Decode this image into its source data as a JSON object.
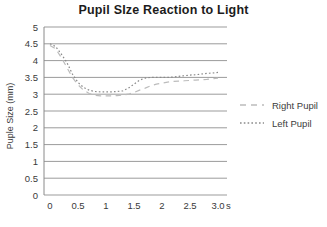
{
  "colors": {
    "background": "#ffffff",
    "grid": "#9b9b9b",
    "axis": "#8a8a8a",
    "tick_text": "#3a3a3a",
    "title_text": "#1c1c1c",
    "right_pupil_line": "#bcbcbc",
    "left_pupil_line": "#8a8a8a"
  },
  "chart_data": {
    "type": "line",
    "title": "Pupil SIze Reaction to Light",
    "ylabel": "Puple Size (mm)",
    "xlabel": "",
    "x_unit": "s",
    "xlim": [
      0,
      3
    ],
    "ylim": [
      0,
      5
    ],
    "grid": "horizontal",
    "legend_position": "right",
    "y_ticks": [
      "0",
      "0.5",
      "1",
      "1.5",
      "2",
      "2.5",
      "3",
      "3.5",
      "4",
      "4.5",
      "5"
    ],
    "x_ticks": [
      "0",
      "0.5",
      "1",
      "1.5",
      "2",
      "2.5",
      "3.0"
    ],
    "x": [
      0,
      0.1,
      0.2,
      0.3,
      0.4,
      0.5,
      0.6,
      0.7,
      0.8,
      0.9,
      1.0,
      1.1,
      1.2,
      1.3,
      1.4,
      1.5,
      1.6,
      1.7,
      1.8,
      1.9,
      2.0,
      2.1,
      2.2,
      2.3,
      2.4,
      2.5,
      2.6,
      2.7,
      2.8,
      2.9,
      3.0
    ],
    "series": [
      {
        "name": "Right Pupil",
        "style": "dashed",
        "color": "#bcbcbc",
        "values": [
          4.45,
          4.35,
          4.1,
          3.8,
          3.5,
          3.28,
          3.12,
          3.02,
          2.97,
          2.95,
          2.95,
          2.95,
          2.96,
          2.98,
          3.0,
          3.05,
          3.12,
          3.18,
          3.25,
          3.3,
          3.33,
          3.36,
          3.38,
          3.39,
          3.4,
          3.41,
          3.42,
          3.43,
          3.44,
          3.46,
          3.48
        ]
      },
      {
        "name": "Left Pupil",
        "style": "dotted",
        "color": "#8a8a8a",
        "values": [
          4.5,
          4.42,
          4.2,
          3.95,
          3.6,
          3.35,
          3.2,
          3.12,
          3.08,
          3.07,
          3.07,
          3.07,
          3.08,
          3.1,
          3.18,
          3.3,
          3.42,
          3.48,
          3.5,
          3.5,
          3.5,
          3.5,
          3.51,
          3.53,
          3.55,
          3.57,
          3.58,
          3.6,
          3.62,
          3.63,
          3.65
        ]
      }
    ]
  }
}
